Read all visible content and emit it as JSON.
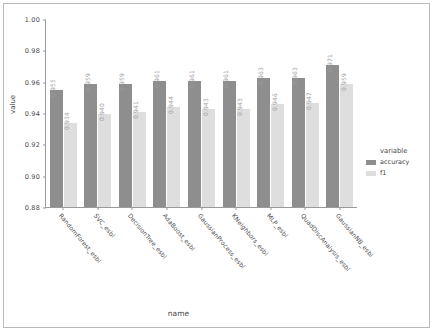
{
  "chart_data": {
    "type": "bar",
    "title": "",
    "xlabel": "name",
    "ylabel": "value",
    "ylim": [
      0.88,
      1.0
    ],
    "yticks": [
      "1.00",
      "0.98",
      "0.96",
      "0.94",
      "0.92",
      "0.90",
      "0.88"
    ],
    "ytick_values": [
      1.0,
      0.98,
      0.96,
      0.94,
      0.92,
      0.9,
      0.88
    ],
    "grid": false,
    "legend_title": "variable",
    "legend_position": "right",
    "categories": [
      "RandomForest_esbl",
      "SVC_esbl",
      "DecisionTree_esbl",
      "AdaBoost_esbl",
      "GaussianProcess_esbl",
      "KNeighbors_esbl",
      "MLP_esbl",
      "QuadDiscAnalysis_esbl",
      "GaussianNB_esbl"
    ],
    "series": [
      {
        "name": "accuracy",
        "color": "#8e8e8e",
        "values": [
          0.955,
          0.959,
          0.959,
          0.961,
          0.961,
          0.961,
          0.963,
          0.963,
          0.971
        ],
        "labels": [
          "0.955",
          "0.959",
          "0.959",
          "0.961",
          "0.961",
          "0.961",
          "0.963",
          "0.963",
          "0.971"
        ]
      },
      {
        "name": "f1",
        "color": "#dedede",
        "values": [
          0.934,
          0.94,
          0.941,
          0.944,
          0.943,
          0.943,
          0.946,
          0.947,
          0.959
        ],
        "labels": [
          "0.934",
          "0.940",
          "0.941",
          "0.944",
          "0.943",
          "0.943",
          "0.946",
          "0.947",
          "0.959"
        ]
      }
    ]
  }
}
